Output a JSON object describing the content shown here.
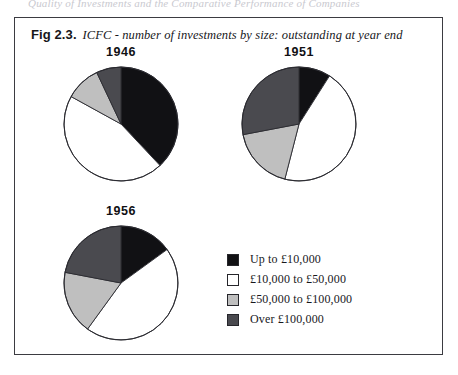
{
  "page": {
    "cutoff_top_text": "Quality of Investments and the Comparative Performance of Companies"
  },
  "figure": {
    "label": "Fig 2.3.",
    "caption": "ICFC - number of investments by size: outstanding at year end"
  },
  "legend": {
    "items": [
      {
        "label": "Up to £10,000",
        "color": "#111114"
      },
      {
        "label": "£10,000 to £50,000",
        "color": "#ffffff"
      },
      {
        "label": "£50,000 to £100,000",
        "color": "#bfbfbf"
      },
      {
        "label": "Over £100,000",
        "color": "#4a4a4f"
      }
    ]
  },
  "chart_data": [
    {
      "type": "pie",
      "title": "1946",
      "labels": [
        "Up to £10,000",
        "£10,000 to £50,000",
        "£50,000 to £100,000",
        "Over £100,000"
      ],
      "values": [
        38,
        45,
        10,
        7
      ],
      "colors": [
        "#111114",
        "#ffffff",
        "#bfbfbf",
        "#4a4a4f"
      ],
      "start_angle": 0,
      "direction": "clockwise",
      "legend_position": "bottom-right",
      "grid": false
    },
    {
      "type": "pie",
      "title": "1951",
      "labels": [
        "Up to £10,000",
        "£10,000 to £50,000",
        "£50,000 to £100,000",
        "Over £100,000"
      ],
      "values": [
        9,
        45,
        18,
        28
      ],
      "colors": [
        "#111114",
        "#ffffff",
        "#bfbfbf",
        "#4a4a4f"
      ],
      "start_angle": 0,
      "direction": "clockwise",
      "legend_position": "bottom-right",
      "grid": false
    },
    {
      "type": "pie",
      "title": "1956",
      "labels": [
        "Up to £10,000",
        "£10,000 to £50,000",
        "£50,000 to £100,000",
        "Over £100,000"
      ],
      "values": [
        15,
        45,
        18,
        22
      ],
      "colors": [
        "#111114",
        "#ffffff",
        "#bfbfbf",
        "#4a4a4f"
      ],
      "start_angle": 0,
      "direction": "clockwise",
      "legend_position": "bottom-right",
      "grid": false
    }
  ]
}
